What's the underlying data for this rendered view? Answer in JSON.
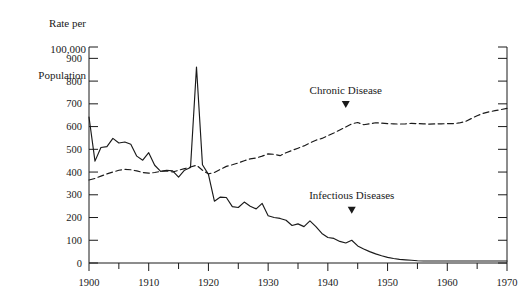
{
  "chart_data": {
    "type": "line",
    "title": "",
    "xlabel": "",
    "ylabel": "Rate per\n100,000\nPopulation",
    "ylabel_lines": [
      "Rate per",
      "100,000",
      "Population"
    ],
    "xlim": [
      1900,
      1970
    ],
    "ylim": [
      0,
      950
    ],
    "y_ticks": [
      0,
      100,
      200,
      300,
      400,
      500,
      600,
      700,
      800,
      900
    ],
    "y_tick_labels": [
      "0",
      "100",
      "200",
      "300",
      "400",
      "500",
      "600",
      "700",
      "800",
      "900"
    ],
    "x_ticks": [
      1900,
      1910,
      1920,
      1930,
      1940,
      1950,
      1960,
      1970
    ],
    "x_tick_labels": [
      "1900",
      "1910",
      "1920",
      "1930",
      "1940",
      "1950",
      "1960",
      "1970"
    ],
    "x_minor_ticks": [
      1905,
      1915,
      1925,
      1935,
      1945,
      1955,
      1965
    ],
    "grid": false,
    "legend_position": "inline-annotations",
    "annotations": [
      {
        "text": "Chronic Disease",
        "x": 1943,
        "y": 745,
        "marker": "▼",
        "marker_x": 1943,
        "marker_y": 690
      },
      {
        "text": "Infectious Diseases",
        "x": 1944,
        "y": 280,
        "marker": "▼",
        "marker_x": 1944,
        "marker_y": 225
      }
    ],
    "series": [
      {
        "name": "Chronic Disease",
        "style": "dashed",
        "color": "#1a1a1a",
        "x": [
          1900,
          1901,
          1902,
          1903,
          1904,
          1905,
          1906,
          1907,
          1908,
          1909,
          1910,
          1911,
          1912,
          1913,
          1914,
          1915,
          1916,
          1917,
          1918,
          1919,
          1920,
          1921,
          1922,
          1923,
          1924,
          1925,
          1926,
          1927,
          1928,
          1929,
          1930,
          1931,
          1932,
          1933,
          1934,
          1935,
          1936,
          1937,
          1938,
          1939,
          1940,
          1941,
          1942,
          1943,
          1944,
          1945,
          1946,
          1947,
          1948,
          1949,
          1950,
          1951,
          1952,
          1953,
          1954,
          1955,
          1956,
          1957,
          1958,
          1959,
          1960,
          1961,
          1962,
          1963,
          1964,
          1965,
          1966,
          1967,
          1968,
          1969,
          1970
        ],
        "values": [
          365,
          372,
          382,
          392,
          400,
          408,
          412,
          410,
          405,
          398,
          395,
          398,
          403,
          405,
          400,
          408,
          415,
          422,
          430,
          408,
          392,
          398,
          412,
          425,
          432,
          440,
          450,
          458,
          462,
          470,
          480,
          478,
          472,
          485,
          495,
          505,
          515,
          528,
          540,
          548,
          560,
          572,
          585,
          598,
          612,
          618,
          608,
          612,
          617,
          615,
          613,
          612,
          611,
          612,
          614,
          613,
          612,
          611,
          612,
          612,
          613,
          613,
          616,
          622,
          635,
          648,
          658,
          665,
          670,
          675,
          680
        ]
      },
      {
        "name": "Infectious Diseases",
        "style": "solid",
        "color": "#1a1a1a",
        "x": [
          1900,
          1901,
          1902,
          1903,
          1904,
          1905,
          1906,
          1907,
          1908,
          1909,
          1910,
          1911,
          1912,
          1913,
          1914,
          1915,
          1916,
          1917,
          1918,
          1919,
          1920,
          1921,
          1922,
          1923,
          1924,
          1925,
          1926,
          1927,
          1928,
          1929,
          1930,
          1931,
          1932,
          1933,
          1934,
          1935,
          1936,
          1937,
          1938,
          1939,
          1940,
          1941,
          1942,
          1943,
          1944,
          1945,
          1946,
          1947,
          1948,
          1949,
          1950,
          1951,
          1952,
          1953,
          1954,
          1955,
          1956,
          1957,
          1958,
          1959,
          1960,
          1961,
          1962,
          1963,
          1964,
          1965,
          1966,
          1967,
          1968,
          1969,
          1970
        ],
        "values": [
          642,
          448,
          508,
          512,
          548,
          528,
          532,
          522,
          470,
          452,
          485,
          430,
          403,
          408,
          405,
          378,
          408,
          420,
          862,
          432,
          390,
          272,
          290,
          288,
          248,
          244,
          268,
          250,
          238,
          262,
          208,
          200,
          196,
          188,
          165,
          172,
          160,
          185,
          160,
          130,
          112,
          108,
          95,
          88,
          100,
          75,
          62,
          50,
          40,
          32,
          25,
          20,
          16,
          14,
          12,
          10,
          9,
          9,
          9,
          9,
          9,
          9,
          9,
          9,
          9,
          9,
          9,
          9,
          9,
          9,
          9
        ]
      }
    ]
  },
  "geometry": {
    "plot_left": 89,
    "plot_right": 507,
    "plot_top": 47,
    "plot_bottom": 263
  }
}
